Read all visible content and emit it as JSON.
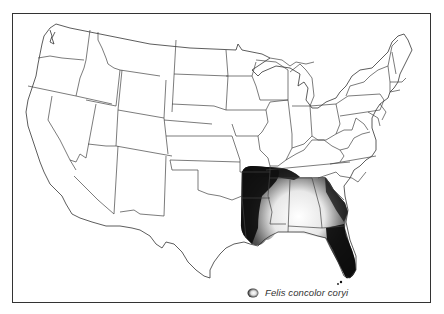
{
  "map": {
    "title": "Range map of the Florida panther",
    "region": "Contiguous United States",
    "frame_color": "#333333",
    "range_color": "#111111",
    "shaded_region": [
      "Arkansas (southern)",
      "Louisiana",
      "Mississippi",
      "Alabama",
      "Georgia",
      "Florida",
      "East Texas",
      "Tennessee (southern)",
      "South Carolina (western)"
    ]
  },
  "legend": {
    "icon": "range-shading-icon",
    "label": "Felis concolor coryi"
  }
}
